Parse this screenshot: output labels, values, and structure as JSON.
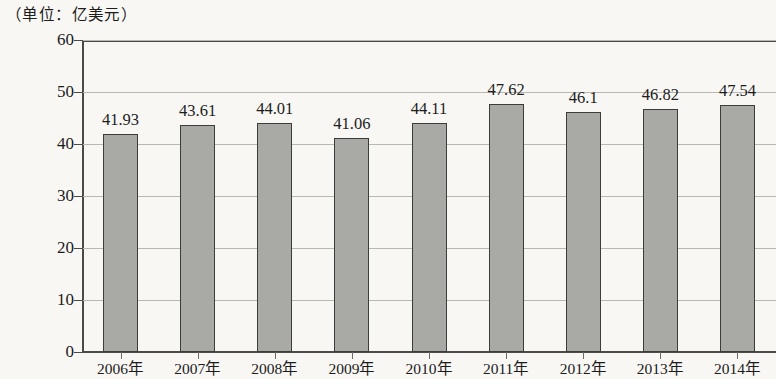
{
  "caption": "（单位：亿美元）",
  "chart_data": {
    "type": "bar",
    "title": "",
    "subtitle": "",
    "unit_note": "（单位：亿美元）",
    "xlabel": "",
    "ylabel": "",
    "ylim": [
      0,
      60
    ],
    "ytick_labels": [
      "0",
      "10",
      "20",
      "30",
      "40",
      "50",
      "60"
    ],
    "ytick_values": [
      0,
      10,
      20,
      30,
      40,
      50,
      60
    ],
    "grid": true,
    "legend": "none",
    "categories": [
      "2006年",
      "2007年",
      "2008年",
      "2009年",
      "2010年",
      "2011年",
      "2012年",
      "2013年",
      "2014年"
    ],
    "values": [
      41.93,
      43.61,
      44.01,
      41.06,
      44.11,
      47.62,
      46.1,
      46.82,
      47.54
    ],
    "data_labels": [
      "41.93",
      "43.61",
      "44.01",
      "41.06",
      "44.11",
      "47.62",
      "46.1",
      "46.82",
      "47.54"
    ],
    "bar_color": "#a9a9a6",
    "bar_border_color": "#3c3c3a",
    "background_color": "#f8f7f4",
    "axis_color": "#4a4a46",
    "grid_color": "#b9b7b2"
  }
}
